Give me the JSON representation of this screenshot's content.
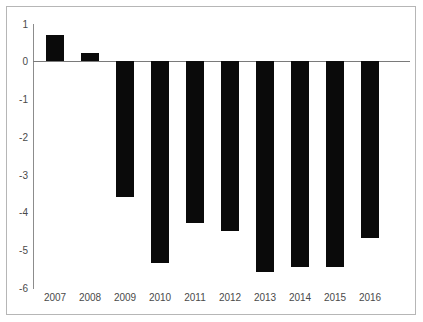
{
  "chart_data": {
    "type": "bar",
    "title": "",
    "subtitle": "",
    "xlabel": "",
    "ylabel": "",
    "categories": [
      "2007",
      "2008",
      "2009",
      "2010",
      "2011",
      "2012",
      "2013",
      "2014",
      "2015",
      "2016"
    ],
    "values": [
      0.7,
      0.2,
      -3.6,
      -5.35,
      -4.3,
      -4.5,
      -5.6,
      -5.45,
      -5.45,
      -4.7
    ],
    "series": [
      {
        "name": "",
        "values": [
          0.7,
          0.2,
          -3.6,
          -5.35,
          -4.3,
          -4.5,
          -5.6,
          -5.45,
          -5.45,
          -4.7
        ]
      }
    ],
    "ylim": [
      -6,
      1
    ],
    "xlim": [
      0,
      10
    ],
    "ytick_labels": [
      "1",
      "0",
      "-1",
      "-2",
      "-3",
      "-4",
      "-5",
      "-6"
    ],
    "ytick_values": [
      1,
      0,
      -1,
      -2,
      -3,
      -4,
      -5,
      -6
    ],
    "grid": false,
    "legend": null,
    "legend_position": "none",
    "annotations": [],
    "bar_color": "#0a0a0a",
    "axis_color": "#8c8c8c",
    "label_color": "#4a4a4a",
    "background_color": "#ffffff",
    "border_color": "#b6b6b6"
  }
}
